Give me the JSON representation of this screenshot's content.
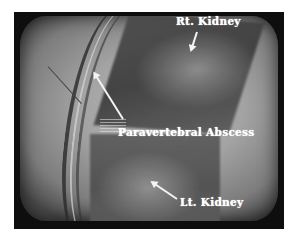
{
  "image": {
    "description": "Ultrasound scan displayed on CRT monitor",
    "colors": {
      "frame": "#0e0e0e",
      "screen_gray": "#a3a3a3",
      "label_text": "#ffffff"
    }
  },
  "annotations": {
    "rt_kidney": "Rt. Kidney",
    "paravertebral_abscess": "Paravertebral Abscess",
    "lt_kidney": "Lt. Kidney"
  }
}
